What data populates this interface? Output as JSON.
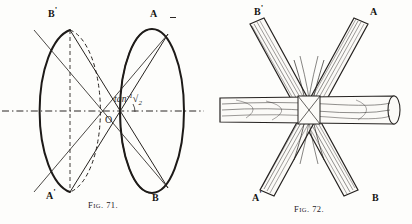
{
  "plate": {
    "background_color": "#fdfdfb",
    "ink_color": "#1a1a1a"
  },
  "figure_71": {
    "caption_prefix": "F",
    "caption_small": "IG",
    "caption_number": ". 71.",
    "caption_full": "FIG. 71.",
    "description": "Two ellipses (end views of a cone pair) joined by crossed generator lines through a central point O, with a horizontal chain axis line.",
    "labels": {
      "top_left": "B",
      "top_left_prime": "'",
      "top_right": "A",
      "bottom_left": "A",
      "bottom_left_prime": "'",
      "bottom_right": "B",
      "center_point": "O"
    },
    "angle_annotation": {
      "function": "tan",
      "exponent": "-1",
      "radical": "√",
      "radical_argument": "2",
      "full_text": "tan⁻¹√2"
    }
  },
  "figure_72": {
    "caption_prefix": "F",
    "caption_small": "IG",
    "caption_number": ". 72.",
    "caption_full": "FIG. 72.",
    "description": "Four wooden rods crossing in an X arrangement with a horizontal wooden rod passing through the central intersection.",
    "labels": {
      "top_left": "B",
      "top_left_prime": "'",
      "top_right": "A",
      "bottom_left": "A",
      "bottom_left_prime": "'",
      "bottom_right": "B"
    }
  }
}
